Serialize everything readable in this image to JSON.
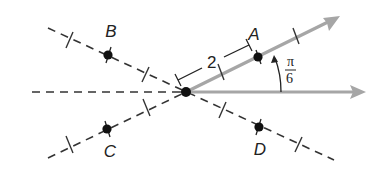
{
  "diagram": {
    "origin": {
      "x": 186,
      "y": 92
    },
    "colors": {
      "ray": "#a6a6a6",
      "dash": "#333333",
      "point": "#111111",
      "text": "#222222"
    },
    "points": [
      {
        "name": "A",
        "x": 258,
        "y": 57,
        "label_x": 253,
        "label_y": 40
      },
      {
        "name": "B",
        "x": 108,
        "y": 55,
        "label_x": 108,
        "label_y": 37
      },
      {
        "name": "C",
        "x": 107,
        "y": 129,
        "label_x": 110,
        "label_y": 156
      },
      {
        "name": "D",
        "x": 259,
        "y": 127,
        "label_x": 260,
        "label_y": 155
      }
    ],
    "distance_label": "2",
    "angle_label": {
      "numerator": "π",
      "denominator": "6"
    },
    "rays": [
      {
        "name": "polar-axis",
        "from": [
          186,
          92
        ],
        "to": [
          364,
          92
        ]
      },
      {
        "name": "terminal-ray",
        "from": [
          186,
          92
        ],
        "to": [
          340,
          16
        ]
      }
    ]
  }
}
